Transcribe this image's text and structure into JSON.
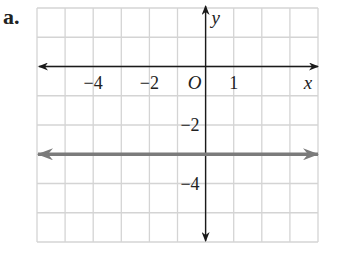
{
  "figure_label": "a.",
  "colors": {
    "grid": "#d4d4d4",
    "axis": "#1a1a1a",
    "graph_line": "#7b7b7b",
    "text": "#222222"
  },
  "axes": {
    "x_name": "x",
    "y_name": "y",
    "origin_label": "O",
    "x_range": [
      -6,
      4
    ],
    "y_range": [
      -6,
      2
    ],
    "x_tick_labels": [
      {
        "value": -4,
        "text": "−4"
      },
      {
        "value": -2,
        "text": "−2"
      },
      {
        "value": 1,
        "text": "1"
      }
    ],
    "y_tick_labels": [
      {
        "value": -2,
        "text": "−2"
      },
      {
        "value": -4,
        "text": "−4"
      }
    ]
  },
  "chart_data": {
    "type": "line",
    "title": "a.",
    "xlabel": "x",
    "ylabel": "y",
    "xlim": [
      -6,
      4
    ],
    "ylim": [
      -6,
      2
    ],
    "grid": true,
    "series": [
      {
        "name": "y = -3",
        "equation": "y = -3",
        "x": [
          -6,
          4
        ],
        "y": [
          -3,
          -3
        ],
        "arrows_both_ends": true
      }
    ]
  }
}
